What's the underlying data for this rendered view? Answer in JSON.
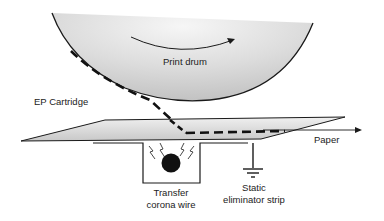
{
  "diagram": {
    "type": "laser-printer-transfer-process",
    "labels": {
      "print_drum": "Print drum",
      "ep_cartridge": "EP Cartridge",
      "paper": "Paper",
      "transfer_corona_line1": "Transfer",
      "transfer_corona_line2": "corona wire",
      "static_strip_line1": "Static",
      "static_strip_line2": "eliminator strip"
    },
    "colors": {
      "line": "#1a1a1a",
      "drum_light": "#f4f4f4",
      "drum_dark": "#b8b8b8",
      "paper_fill": "#d4d4d4",
      "background": "#ffffff"
    }
  }
}
